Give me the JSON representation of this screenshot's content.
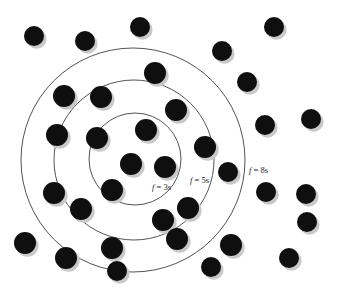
{
  "figure": {
    "background_color": "#ffffff",
    "width": 342,
    "height": 292,
    "node_color": "#100f0f",
    "node_shadow_color": "#c9c9c9",
    "ring_stroke_color": "#3f3f3f"
  },
  "chart_data": {
    "type": "scatter",
    "title": "",
    "xlabel": "",
    "ylabel": "",
    "xlim": [
      0,
      342
    ],
    "ylim": [
      0,
      292
    ],
    "grid": false,
    "legend_position": "inline-annotations",
    "annotations": [
      {
        "id": "label-f3",
        "text_prefix": "f",
        "text_value": " = 3s",
        "full_text": "f = 3s",
        "x": 152,
        "y": 190,
        "ring": "inner"
      },
      {
        "id": "label-f5",
        "text_prefix": "f",
        "text_value": " = 5s",
        "full_text": "f = 5s",
        "x": 190,
        "y": 183,
        "ring": "middle"
      },
      {
        "id": "label-f8",
        "text_prefix": "f",
        "text_value": " = 8s",
        "full_text": "f = 8s",
        "x": 249,
        "y": 173,
        "ring": "outer"
      }
    ],
    "rings": [
      {
        "id": "ring-inner",
        "label": "f = 3s",
        "cx": 135,
        "cy": 159,
        "r": 46
      },
      {
        "id": "ring-middle",
        "label": "f = 5s",
        "cx": 134,
        "cy": 160,
        "r": 80
      },
      {
        "id": "ring-outer",
        "label": "f = 8s",
        "cx": 133,
        "cy": 160,
        "r": 112
      }
    ],
    "series": [
      {
        "name": "nodes",
        "marker": "filled-circle",
        "marker_radius": 10,
        "points": [
          {
            "x": 34,
            "y": 36,
            "r": 10
          },
          {
            "x": 85,
            "y": 41,
            "r": 10
          },
          {
            "x": 140,
            "y": 27,
            "r": 10
          },
          {
            "x": 222,
            "y": 51,
            "r": 10
          },
          {
            "x": 274,
            "y": 27,
            "r": 10
          },
          {
            "x": 155,
            "y": 73,
            "r": 11
          },
          {
            "x": 247,
            "y": 82,
            "r": 10
          },
          {
            "x": 64,
            "y": 96,
            "r": 11
          },
          {
            "x": 101,
            "y": 97,
            "r": 11
          },
          {
            "x": 265,
            "y": 125,
            "r": 10
          },
          {
            "x": 311,
            "y": 119,
            "r": 10
          },
          {
            "x": 176,
            "y": 110,
            "r": 11
          },
          {
            "x": 57,
            "y": 135,
            "r": 11
          },
          {
            "x": 97,
            "y": 138,
            "r": 11
          },
          {
            "x": 146,
            "y": 130,
            "r": 11
          },
          {
            "x": 205,
            "y": 147,
            "r": 11
          },
          {
            "x": 131,
            "y": 164,
            "r": 11
          },
          {
            "x": 165,
            "y": 167,
            "r": 11
          },
          {
            "x": 228,
            "y": 172,
            "r": 10
          },
          {
            "x": 266,
            "y": 192,
            "r": 10
          },
          {
            "x": 306,
            "y": 194,
            "r": 10
          },
          {
            "x": 112,
            "y": 190,
            "r": 11
          },
          {
            "x": 54,
            "y": 193,
            "r": 11
          },
          {
            "x": 81,
            "y": 209,
            "r": 11
          },
          {
            "x": 188,
            "y": 208,
            "r": 11
          },
          {
            "x": 163,
            "y": 220,
            "r": 11
          },
          {
            "x": 25,
            "y": 243,
            "r": 11
          },
          {
            "x": 66,
            "y": 258,
            "r": 11
          },
          {
            "x": 112,
            "y": 248,
            "r": 11
          },
          {
            "x": 177,
            "y": 239,
            "r": 11
          },
          {
            "x": 231,
            "y": 245,
            "r": 11
          },
          {
            "x": 117,
            "y": 271,
            "r": 10
          },
          {
            "x": 211,
            "y": 267,
            "r": 10
          },
          {
            "x": 289,
            "y": 258,
            "r": 10
          },
          {
            "x": 307,
            "y": 222,
            "r": 10
          }
        ]
      }
    ]
  }
}
